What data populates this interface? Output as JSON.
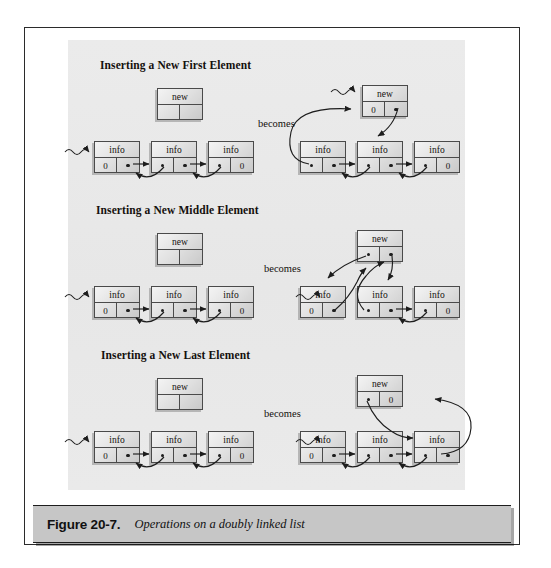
{
  "figure": {
    "number": "Figure 20-7.",
    "caption": "Operations on a doubly linked list"
  },
  "labels": {
    "becomes": "becomes",
    "new": "new",
    "info": "info",
    "null": "0",
    "pointer_dot": "pointer-dot",
    "head_arrow": "squiggly-head-arrow"
  },
  "sections": [
    {
      "id": "first",
      "heading": "Inserting a New First Element",
      "before": {
        "new_node": {
          "top": "new",
          "left": "",
          "right": ""
        },
        "list": [
          {
            "top": "info",
            "left": "0",
            "right": "pointer"
          },
          {
            "top": "info",
            "left": "pointer",
            "right": "pointer"
          },
          {
            "top": "info",
            "left": "pointer",
            "right": "0"
          }
        ]
      },
      "after": {
        "new_node": {
          "top": "new",
          "left": "0",
          "right": "pointer"
        },
        "list": [
          {
            "top": "info",
            "left": "pointer",
            "right": "pointer"
          },
          {
            "top": "info",
            "left": "pointer",
            "right": "pointer"
          },
          {
            "top": "info",
            "left": "pointer",
            "right": "0"
          }
        ]
      }
    },
    {
      "id": "middle",
      "heading": "Inserting a New Middle Element",
      "before": {
        "new_node": {
          "top": "new",
          "left": "",
          "right": ""
        },
        "list": [
          {
            "top": "info",
            "left": "0",
            "right": "pointer"
          },
          {
            "top": "info",
            "left": "pointer",
            "right": "pointer"
          },
          {
            "top": "info",
            "left": "pointer",
            "right": "0"
          }
        ]
      },
      "after": {
        "new_node": {
          "top": "new",
          "left": "pointer",
          "right": "pointer"
        },
        "list": [
          {
            "top": "info",
            "left": "0",
            "right": "pointer"
          },
          {
            "top": "info",
            "left": "pointer",
            "right": "pointer"
          },
          {
            "top": "info",
            "left": "pointer",
            "right": "0"
          }
        ]
      }
    },
    {
      "id": "last",
      "heading": "Inserting a New Last Element",
      "before": {
        "new_node": {
          "top": "new",
          "left": "",
          "right": ""
        },
        "list": [
          {
            "top": "info",
            "left": "0",
            "right": "pointer"
          },
          {
            "top": "info",
            "left": "pointer",
            "right": "pointer"
          },
          {
            "top": "info",
            "left": "pointer",
            "right": "0"
          }
        ]
      },
      "after": {
        "new_node": {
          "top": "new",
          "left": "pointer",
          "right": "0"
        },
        "list": [
          {
            "top": "info",
            "left": "0",
            "right": "pointer"
          },
          {
            "top": "info",
            "left": "pointer",
            "right": "pointer"
          },
          {
            "top": "info",
            "left": "pointer",
            "right": "pointer"
          }
        ]
      }
    }
  ],
  "colors": {
    "panel_bg": "#eaeaea",
    "node_border": "#4a4a4a",
    "caption_bg": "#c6c6c6",
    "frame_border": "#2b2b2b",
    "ink": "#14100d"
  }
}
